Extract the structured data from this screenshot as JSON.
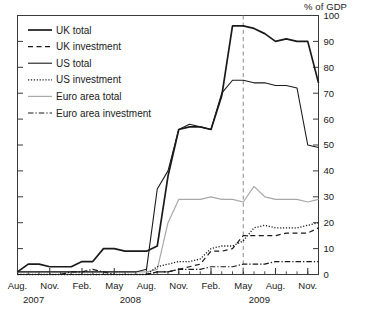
{
  "chart_data": {
    "type": "line",
    "title": "",
    "subtitle": "",
    "unit_label": "% of GDP",
    "ylabel": "",
    "xlabel": "",
    "ylim": [
      0,
      100
    ],
    "yticks": [
      0,
      10,
      20,
      30,
      40,
      50,
      60,
      70,
      80,
      90,
      100
    ],
    "grid": false,
    "legend_position": "top-left",
    "x_tick_labels": [
      "Aug.",
      "Nov.",
      "Feb.",
      "May",
      "Aug.",
      "Nov.",
      "Feb.",
      "May",
      "Aug.",
      "Nov."
    ],
    "x_year_labels": [
      "2007",
      "2008",
      "2009"
    ],
    "x_minor_ticks_monthly": true,
    "annotations": [
      {
        "type": "vertical-dashed-line",
        "at": "May 2009",
        "color": "#8a8a8a"
      }
    ],
    "x": [
      "2007-08",
      "2007-09",
      "2007-10",
      "2007-11",
      "2007-12",
      "2008-01",
      "2008-02",
      "2008-03",
      "2008-04",
      "2008-05",
      "2008-06",
      "2008-07",
      "2008-08",
      "2008-09",
      "2008-10",
      "2008-11",
      "2008-12",
      "2009-01",
      "2009-02",
      "2009-03",
      "2009-04",
      "2009-05",
      "2009-06",
      "2009-07",
      "2009-08",
      "2009-09",
      "2009-10",
      "2009-11",
      "2009-12"
    ],
    "series": [
      {
        "name": "UK total",
        "style": "solid",
        "width": 1.7,
        "color": "#1a1a1a",
        "values": [
          1,
          4,
          4,
          3,
          3,
          3,
          5,
          5,
          10,
          10,
          9,
          9,
          9,
          11,
          38,
          56,
          57,
          57,
          56,
          69,
          96,
          96,
          95,
          93,
          90,
          91,
          90,
          90,
          74
        ]
      },
      {
        "name": "UK investment",
        "style": "dashed",
        "width": 1.2,
        "color": "#1a1a1a",
        "values": [
          0,
          0,
          0,
          0,
          0,
          0,
          0,
          0,
          0,
          0,
          0,
          0,
          0,
          1,
          1,
          2,
          3,
          4,
          9,
          9,
          10,
          15,
          15,
          15,
          15,
          16,
          16,
          16,
          18
        ]
      },
      {
        "name": "US total",
        "style": "solid",
        "width": 1.1,
        "color": "#1a1a1a",
        "values": [
          1,
          1,
          1,
          1,
          1,
          1,
          1,
          1,
          1,
          1,
          1,
          1,
          2,
          33,
          40,
          56,
          58,
          57,
          56,
          70,
          75,
          75,
          74,
          74,
          73,
          73,
          72,
          50,
          49
        ]
      },
      {
        "name": "US investment",
        "style": "dotted",
        "width": 1.3,
        "color": "#1a1a1a",
        "values": [
          0,
          0,
          0,
          0,
          0,
          0,
          0,
          0,
          0,
          0,
          0,
          0,
          0,
          3,
          4,
          5,
          5,
          6,
          10,
          11,
          11,
          13,
          18,
          19,
          18,
          18,
          18,
          19,
          20
        ]
      },
      {
        "name": "Euro area  total",
        "style": "solid",
        "width": 1.2,
        "color": "#a8a8a8",
        "values": [
          1,
          1,
          1,
          1,
          1,
          1,
          1,
          1,
          1,
          1,
          1,
          1,
          1,
          2,
          20,
          29,
          29,
          29,
          30,
          29,
          29,
          28,
          34,
          30,
          29,
          29,
          29,
          28,
          29
        ]
      },
      {
        "name": "Euro area investment",
        "style": "dashdot",
        "width": 1.2,
        "color": "#1a1a1a",
        "values": [
          0,
          0,
          0,
          0,
          0,
          1,
          1,
          2,
          1,
          0,
          0,
          0,
          0,
          1,
          1,
          2,
          2,
          2,
          3,
          3,
          3,
          4,
          4,
          4,
          5,
          5,
          5,
          5,
          5
        ]
      }
    ]
  },
  "legend": {
    "items": [
      {
        "label": "UK total"
      },
      {
        "label": "UK investment"
      },
      {
        "label": "US total"
      },
      {
        "label": "US investment"
      },
      {
        "label": "Euro area  total"
      },
      {
        "label": "Euro area investment"
      }
    ]
  }
}
